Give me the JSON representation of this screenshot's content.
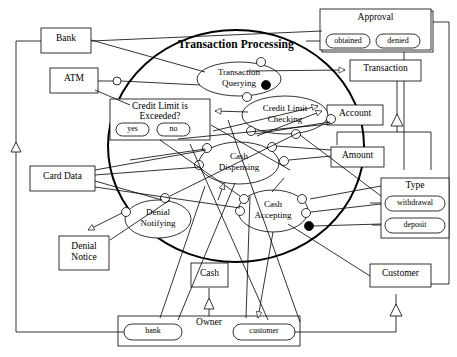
{
  "diagram": {
    "title": "Transaction Processing",
    "type": "uml-use-case-collaboration",
    "stroke_color": "#000000",
    "fill_color": "#ffffff"
  },
  "boundary": {
    "name": "transaction-processing-boundary",
    "label": "Transaction Processing"
  },
  "use_cases": [
    {
      "id": "transaction-querying",
      "line1": "Transaction",
      "line2": "Querying"
    },
    {
      "id": "credit-limit-checking",
      "line1": "Credit Limit",
      "line2": "Checking"
    },
    {
      "id": "cash-dispensing",
      "line1": "Cash",
      "line2": "Dispensing"
    },
    {
      "id": "cash-accepting",
      "line1": "Cash",
      "line2": "Accepting"
    },
    {
      "id": "denial-notifying",
      "line1": "Denial",
      "line2": "Notifying"
    }
  ],
  "classes": [
    {
      "id": "bank",
      "label": "Bank"
    },
    {
      "id": "atm",
      "label": "ATM"
    },
    {
      "id": "card-data",
      "label": "Card Data"
    },
    {
      "id": "denial-notice-l1",
      "label": "Denial"
    },
    {
      "id": "denial-notice-l2",
      "label": "Notice"
    },
    {
      "id": "cash",
      "label": "Cash"
    },
    {
      "id": "transaction",
      "label": "Transaction"
    },
    {
      "id": "account",
      "label": "Account"
    },
    {
      "id": "amount",
      "label": "Amount"
    },
    {
      "id": "customer",
      "label": "Customer"
    }
  ],
  "enumerations": [
    {
      "id": "approval",
      "label": "Approval",
      "literals": [
        "obtained",
        "denied"
      ]
    },
    {
      "id": "credit-limit-is-exceeded",
      "label_line1": "Credit Limit is",
      "label_line2": "Exceeded?",
      "literals": [
        "yes",
        "no"
      ]
    },
    {
      "id": "type",
      "label": "Type",
      "literals": [
        "withdrawal",
        "deposit"
      ]
    },
    {
      "id": "owner",
      "label": "Owner",
      "literals": [
        "bank",
        "customer"
      ]
    }
  ]
}
